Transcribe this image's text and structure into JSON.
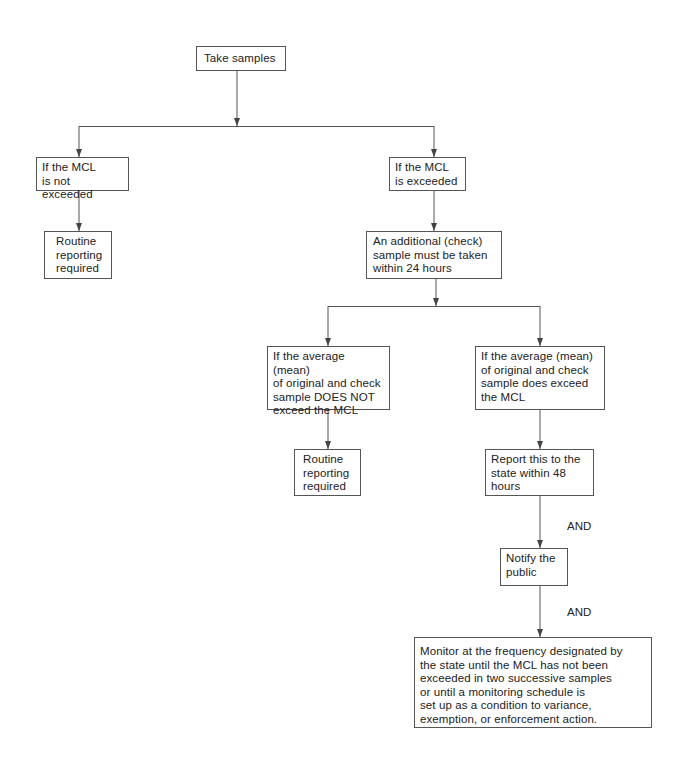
{
  "flowchart": {
    "nodes": {
      "take_samples": "Take samples",
      "mcl_not_exceeded": "If the MCL\nis not exceeded",
      "mcl_exceeded": "If the MCL\nis exceeded",
      "routine_1": "Routine\nreporting\nrequired",
      "check_sample": "An additional (check)\nsample must be taken\nwithin 24 hours",
      "avg_not_exceed": "If the average (mean)\nof original and check\nsample DOES NOT\nexceed the MCL",
      "avg_exceed": "If the average (mean)\nof original and check\nsample does exceed\nthe MCL",
      "routine_2": "Routine\nreporting\nrequired",
      "report_state": "Report this to the\nstate within 48\nhours",
      "notify_public": "Notify the\npublic",
      "monitor": "Monitor at the frequency designated by\nthe state until the MCL has not been\nexceeded in two successive samples\nor until a monitoring schedule is\nset up as a condition to variance,\nexemption, or enforcement action."
    },
    "labels": {
      "and_1": "AND",
      "and_2": "AND"
    },
    "colors": {
      "line": "#555555",
      "text": "#222222",
      "background": "#ffffff"
    }
  }
}
